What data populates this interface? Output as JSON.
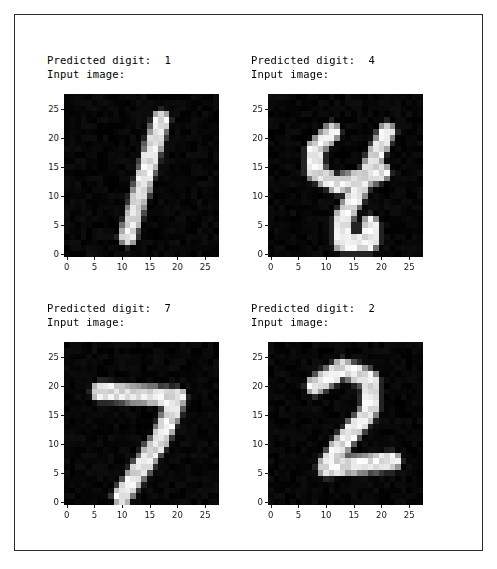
{
  "figure": {
    "background_color": "#ffffff",
    "frame_color": "#2a2a2a",
    "width": 497,
    "height": 569
  },
  "subplots": [
    {
      "id": "subplot-top-left",
      "title_line1": "Predicted digit:  1",
      "title_line2": "Input image:",
      "predicted_digit": "1",
      "position": {
        "left": 63,
        "top": 93,
        "width": 155,
        "height": 163
      },
      "title_position": {
        "left": 46,
        "top": 53
      }
    },
    {
      "id": "subplot-top-right",
      "title_line1": "Predicted digit:  4",
      "title_line2": "Input image:",
      "predicted_digit": "4",
      "position": {
        "left": 267,
        "top": 93,
        "width": 155,
        "height": 163
      },
      "title_position": {
        "left": 250,
        "top": 53
      }
    },
    {
      "id": "subplot-bottom-left",
      "title_line1": "Predicted digit:  7",
      "title_line2": "Input image:",
      "predicted_digit": "7",
      "position": {
        "left": 63,
        "top": 341,
        "width": 155,
        "height": 163
      },
      "title_position": {
        "left": 46,
        "top": 301
      }
    },
    {
      "id": "subplot-bottom-right",
      "title_line1": "Predicted digit:  2",
      "title_line2": "Input image:",
      "predicted_digit": "2",
      "position": {
        "left": 267,
        "top": 341,
        "width": 155,
        "height": 163
      },
      "title_position": {
        "left": 250,
        "top": 301
      }
    }
  ],
  "axes": {
    "x_ticks": [
      "0",
      "5",
      "10",
      "15",
      "20",
      "25"
    ],
    "y_ticks": [
      "0",
      "5",
      "10",
      "15",
      "20",
      "25"
    ],
    "tick_values": [
      0,
      5,
      10,
      15,
      20,
      25
    ],
    "x_range": [
      -0.5,
      27.5
    ],
    "y_range": [
      27.5,
      -0.5
    ],
    "grid": false,
    "tick_color": "#1a1a1a"
  },
  "chart_data": {
    "type": "heatmap",
    "colormap": "gray",
    "vmin": 0,
    "vmax": 255,
    "grid_size": [
      28,
      28
    ],
    "xlabel": "",
    "ylabel": "",
    "panels": [
      {
        "label": "Predicted digit:  1",
        "digit": 1,
        "strokes": [
          {
            "type": "segment",
            "from": [
              17,
              4
            ],
            "to": [
              11,
              24
            ],
            "width": 2.2
          }
        ]
      },
      {
        "label": "Predicted digit:  4",
        "digit": 4,
        "strokes": [
          {
            "type": "segment",
            "from": [
              11,
              6
            ],
            "to": [
              8,
              9
            ],
            "width": 2.2
          },
          {
            "type": "segment",
            "from": [
              8,
              9
            ],
            "to": [
              8,
              13
            ],
            "width": 2.2
          },
          {
            "type": "segment",
            "from": [
              8,
              13
            ],
            "to": [
              12,
              15
            ],
            "width": 2.2
          },
          {
            "type": "segment",
            "from": [
              12,
              15
            ],
            "to": [
              20,
              13
            ],
            "width": 2.2
          },
          {
            "type": "segment",
            "from": [
              21,
              6
            ],
            "to": [
              17,
              14
            ],
            "width": 2.2
          },
          {
            "type": "segment",
            "from": [
              17,
              14
            ],
            "to": [
              13,
              21
            ],
            "width": 2.2
          },
          {
            "type": "segment",
            "from": [
              13,
              21
            ],
            "to": [
              13,
              25
            ],
            "width": 2.2
          },
          {
            "type": "segment",
            "from": [
              13,
              25
            ],
            "to": [
              18,
              25
            ],
            "width": 2.2
          },
          {
            "type": "segment",
            "from": [
              18,
              25
            ],
            "to": [
              18,
              22
            ],
            "width": 2.2
          }
        ]
      },
      {
        "label": "Predicted digit:  7",
        "digit": 7,
        "strokes": [
          {
            "type": "segment",
            "from": [
              6,
              8
            ],
            "to": [
              20,
              9
            ],
            "width": 2.4
          },
          {
            "type": "segment",
            "from": [
              20,
              9
            ],
            "to": [
              17,
              16
            ],
            "width": 2.4
          },
          {
            "type": "segment",
            "from": [
              17,
              16
            ],
            "to": [
              10,
              26
            ],
            "width": 2.4
          }
        ]
      },
      {
        "label": "Predicted digit:  2",
        "digit": 2,
        "strokes": [
          {
            "type": "segment",
            "from": [
              8,
              7
            ],
            "to": [
              13,
              4
            ],
            "width": 2.3
          },
          {
            "type": "segment",
            "from": [
              13,
              4
            ],
            "to": [
              18,
              6
            ],
            "width": 2.3
          },
          {
            "type": "segment",
            "from": [
              18,
              6
            ],
            "to": [
              18,
              11
            ],
            "width": 2.3
          },
          {
            "type": "segment",
            "from": [
              18,
              11
            ],
            "to": [
              12,
              18
            ],
            "width": 2.3
          },
          {
            "type": "segment",
            "from": [
              12,
              18
            ],
            "to": [
              10,
              21
            ],
            "width": 2.3
          },
          {
            "type": "segment",
            "from": [
              10,
              21
            ],
            "to": [
              22,
              20
            ],
            "width": 2.3
          }
        ]
      }
    ]
  }
}
